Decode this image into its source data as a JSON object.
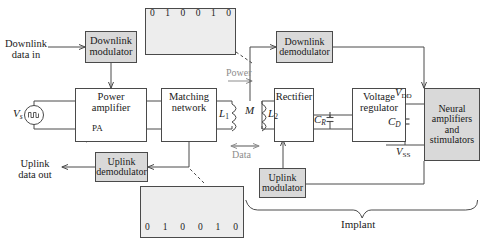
{
  "diagram": {
    "colors": {
      "shaded_block": "#d9d9d9",
      "wave_panel": "#ededed",
      "line": "#4a4a4a",
      "gray_text": "#8d8d8d"
    }
  },
  "external": {
    "downlink_in": "Downlink\ndata in",
    "downlink_in_line1": "Downlink",
    "downlink_in_line2": "data in",
    "uplink_out_line1": "Uplink",
    "uplink_out_line2": "data out"
  },
  "blocks": {
    "downlink_modulator": {
      "line1": "Downlink",
      "line2": "modulator",
      "shaded": true
    },
    "power_amplifier": {
      "line1": "Power",
      "line2": "amplifier",
      "symbol": "PA",
      "shaded": false
    },
    "matching_network": {
      "line1": "Matching",
      "line2": "network",
      "shaded": false
    },
    "uplink_demodulator": {
      "line1": "Uplink",
      "line2": "demodulator",
      "shaded": true
    },
    "downlink_demodulator": {
      "line1": "Downlink",
      "line2": "demodulator",
      "shaded": true
    },
    "rectifier": {
      "line1": "Rectifier",
      "shaded": false
    },
    "voltage_regulator": {
      "line1": "Voltage",
      "line2": "regulator",
      "shaded": false
    },
    "neural_block": {
      "line1": "Neural",
      "line2": "amplifiers",
      "line3": "and",
      "line4": "stimulators",
      "shaded": true
    },
    "uplink_modulator": {
      "line1": "Uplink",
      "line2": "modulator",
      "shaded": true
    }
  },
  "labels": {
    "source": "V",
    "source_sub": "s",
    "coil_primary": "L",
    "coil_primary_sub": "1",
    "coil_secondary": "L",
    "coil_secondary_sub": "2",
    "mutual": "M",
    "power_arrow": "Power",
    "data_arrow": "Data",
    "cap_rect": "C",
    "cap_rect_sub": "R",
    "cap_decouple": "C",
    "cap_decouple_sub": "D",
    "vdd": "V",
    "vdd_sub": "DD",
    "vss": "V",
    "vss_sub": "SS",
    "implant": "Implant"
  },
  "waveforms": {
    "downlink": {
      "name": "downlink-ask-waveform",
      "bits": [
        "0",
        "1",
        "0",
        "0",
        "1",
        "0"
      ],
      "modulation": "ASK burst (carrier present on low-level segments)",
      "bursts": [
        1,
        0,
        1,
        1,
        0,
        1
      ]
    },
    "uplink": {
      "name": "uplink-lsk-waveform",
      "bits": [
        "0",
        "1",
        "0",
        "0",
        "1",
        "0"
      ],
      "modulation": "Load-shift-keyed continuous carrier with amplitude steps",
      "envelope": [
        1.0,
        0.62,
        1.0,
        1.0,
        0.62,
        1.0
      ]
    }
  }
}
